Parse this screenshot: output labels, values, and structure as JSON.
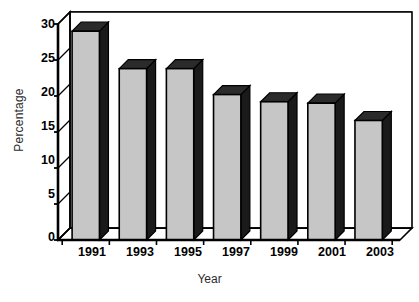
{
  "chart_data": {
    "type": "bar",
    "title": "",
    "subtitle": "",
    "xlabel": "Year",
    "ylabel": "Percentage",
    "categories": [
      "1991",
      "1993",
      "1995",
      "1997",
      "1999",
      "2001",
      "2003"
    ],
    "values": [
      29.0,
      23.8,
      23.8,
      20.2,
      19.2,
      19.0,
      16.6
    ],
    "series": [
      {
        "name": "Percentage",
        "values": [
          29.0,
          23.8,
          23.8,
          20.2,
          19.2,
          19.0,
          16.6
        ]
      }
    ],
    "ylim": [
      0,
      30
    ],
    "yticks": [
      0,
      5,
      10,
      15,
      20,
      25,
      30
    ],
    "ytick_labels": [
      "0",
      "5",
      "10",
      "15",
      "20",
      "25",
      "30"
    ],
    "xlim_categories": 7,
    "grid": "horizontal",
    "legend": "none",
    "style": "3d-column",
    "colors": {
      "bar_front": "#c6c6c6",
      "bar_top": "#2b2b2b",
      "bar_side": "#1a1a1a",
      "outline": "#000000",
      "grid": "#000000",
      "background": "#ffffff",
      "axis_text": "#000000",
      "axis_title_text": "#2b2b2b"
    }
  },
  "axes": {
    "y_title": "Percentage",
    "x_title": "Year"
  }
}
